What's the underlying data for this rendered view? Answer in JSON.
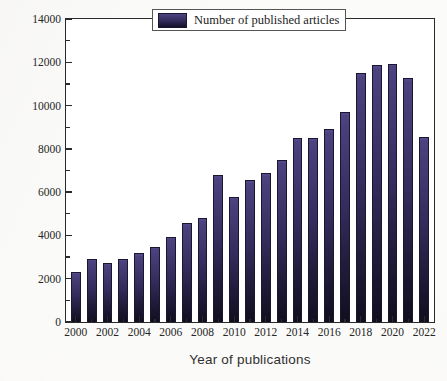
{
  "chart_data": {
    "type": "bar",
    "title": "",
    "xlabel": "Year of publications",
    "ylabel": "Number of published articles",
    "categories": [
      "2000",
      "2001",
      "2002",
      "2003",
      "2004",
      "2005",
      "2006",
      "2007",
      "2008",
      "2009",
      "2010",
      "2011",
      "2012",
      "2013",
      "2014",
      "2015",
      "2016",
      "2017",
      "2018",
      "2019",
      "2020",
      "2021",
      "2022"
    ],
    "values": [
      2330,
      2930,
      2730,
      2930,
      3180,
      3470,
      3930,
      4560,
      4800,
      6770,
      5780,
      6540,
      6880,
      7470,
      8500,
      8500,
      8900,
      9700,
      11500,
      11870,
      11940,
      11270,
      8530
    ],
    "series": [
      {
        "name": "Number of published articles",
        "values": [
          2330,
          2930,
          2730,
          2930,
          3180,
          3470,
          3930,
          4560,
          4800,
          6770,
          5780,
          6540,
          6880,
          7470,
          8500,
          8500,
          8900,
          9700,
          11500,
          11870,
          11940,
          11270,
          8530
        ]
      }
    ],
    "ylim": [
      0,
      14000
    ],
    "ytick_labels": [
      "0",
      "2000",
      "4000",
      "6000",
      "8000",
      "10000",
      "12000",
      "14000"
    ],
    "ytick_values": [
      0,
      2000,
      4000,
      6000,
      8000,
      10000,
      12000,
      14000
    ],
    "yminor_values": [
      1000,
      3000,
      5000,
      7000,
      9000,
      11000,
      13000
    ],
    "xtick_labels": [
      "2000",
      "2002",
      "2004",
      "2006",
      "2008",
      "2010",
      "2012",
      "2014",
      "2016",
      "2018",
      "2020",
      "2022"
    ],
    "xtick_values": [
      2000,
      2002,
      2004,
      2006,
      2008,
      2010,
      2012,
      2014,
      2016,
      2018,
      2020,
      2022
    ],
    "xminor_values": [
      2001,
      2003,
      2005,
      2007,
      2009,
      2011,
      2013,
      2015,
      2017,
      2019,
      2021
    ],
    "grid": false,
    "legend": {
      "position": "top-right-inside",
      "entries": [
        "Number of published articles"
      ]
    },
    "colors": {
      "bar_top": "#4c4380",
      "bar_bottom": "#110e1e",
      "bar_outline": "#1a1630",
      "axis": "#2a2a2a",
      "text": "#262626",
      "background": "#ffffff"
    }
  },
  "legend": {
    "label": "Number of published articles"
  },
  "axes": {
    "x_title": "Year of publications",
    "y_title": "Number of published articles"
  }
}
